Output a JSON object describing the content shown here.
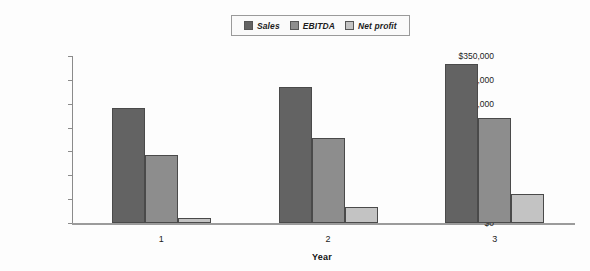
{
  "chart_data": {
    "type": "bar",
    "title": "",
    "xlabel": "Year",
    "ylabel": "",
    "categories": [
      "1",
      "2",
      "3"
    ],
    "series": [
      {
        "name": "Sales",
        "color": "#636363",
        "values": [
          241000,
          285000,
          333000
        ]
      },
      {
        "name": "EBITDA",
        "color": "#8d8d8d",
        "values": [
          143000,
          178000,
          220000
        ]
      },
      {
        "name": "Net profit",
        "color": "#c3c3c3",
        "values": [
          10000,
          34000,
          61000
        ]
      }
    ],
    "ylim": [
      0,
      350000
    ],
    "ytick_values": [
      0,
      50000,
      100000,
      150000,
      200000,
      250000,
      300000,
      350000
    ],
    "ytick_labels": [
      "$0",
      "$50,000",
      "$100,000",
      "$150,000",
      "$200,000",
      "$250,000",
      "$300,000",
      "$350,000"
    ],
    "grid": false,
    "legend_position": "top-center"
  },
  "colors": {
    "sales": "#636363",
    "ebitda": "#8d8d8d",
    "net_profit": "#c3c3c3",
    "axis": "#8b8b8b",
    "text": "#1c1c1c",
    "background": "#fdfdfd"
  }
}
